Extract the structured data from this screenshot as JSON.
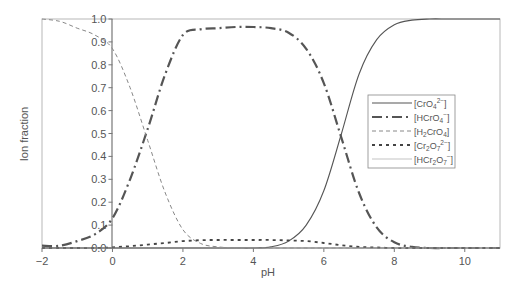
{
  "chart_data": {
    "type": "line",
    "title": "",
    "xlabel": "pH",
    "ylabel": "Ion fraction",
    "xlim": [
      -2,
      11
    ],
    "ylim": [
      0,
      1.0
    ],
    "x_ticks": [
      -2,
      0,
      2,
      4,
      6,
      8,
      10
    ],
    "x_tick_labels": [
      "−2",
      "0",
      "2",
      "4",
      "6",
      "8",
      "10"
    ],
    "y_ticks": [
      0.0,
      0.1,
      0.2,
      0.3,
      0.4,
      0.5,
      0.6,
      0.7,
      0.8,
      0.9,
      1.0
    ],
    "y_tick_labels": [
      "0.0",
      "0.1",
      "0.2",
      "0.3",
      "0.4",
      "0.5",
      "0.6",
      "0.7",
      "0.8",
      "0.9",
      "1.0"
    ],
    "grid": false,
    "legend_position": "right-middle",
    "x": [
      -2,
      -1.5,
      -1,
      -0.5,
      0,
      0.5,
      1,
      1.5,
      2,
      2.5,
      3,
      3.5,
      4,
      4.5,
      5,
      5.5,
      6,
      6.5,
      7,
      7.5,
      8,
      8.5,
      9,
      9.5,
      10,
      10.5,
      11
    ],
    "series": [
      {
        "name": "[CrO4 2-]",
        "label_parts": [
          "[CrO",
          "4",
          "2−",
          "]"
        ],
        "style": "solid",
        "color": "#555555",
        "width": 1.1,
        "values": [
          0,
          0,
          0,
          0,
          0,
          0,
          0,
          0,
          0,
          0,
          0,
          0,
          0,
          0.005,
          0.03,
          0.1,
          0.25,
          0.5,
          0.76,
          0.91,
          0.975,
          0.995,
          1.0,
          1.0,
          1.0,
          1.0,
          1.0
        ]
      },
      {
        "name": "[HCrO4 -]",
        "label_parts": [
          "[HCrO",
          "4",
          "−",
          "]"
        ],
        "style": "dashdot",
        "color": "#555555",
        "width": 2.2,
        "values": [
          0.01,
          0.01,
          0.03,
          0.06,
          0.13,
          0.3,
          0.52,
          0.76,
          0.93,
          0.955,
          0.96,
          0.965,
          0.965,
          0.96,
          0.94,
          0.87,
          0.72,
          0.48,
          0.24,
          0.09,
          0.025,
          0.005,
          0,
          0,
          0,
          0,
          0
        ]
      },
      {
        "name": "[H2CrO4]",
        "label_parts": [
          "[H",
          "2",
          "CrO",
          "4",
          "]"
        ],
        "style": "dashed",
        "color": "#888888",
        "width": 1.0,
        "values": [
          1.0,
          0.99,
          0.96,
          0.93,
          0.87,
          0.7,
          0.47,
          0.24,
          0.08,
          0.02,
          0.005,
          0,
          0,
          0,
          0,
          0,
          0,
          0,
          0,
          0,
          0,
          0,
          0,
          0,
          0,
          0,
          0
        ]
      },
      {
        "name": "[Cr2O7 2-]",
        "label_parts": [
          "[Cr",
          "2",
          "O",
          "7",
          "2−",
          "]"
        ],
        "style": "dotted",
        "color": "#444444",
        "width": 1.8,
        "values": [
          0,
          0,
          0,
          0,
          0.003,
          0.008,
          0.015,
          0.022,
          0.03,
          0.034,
          0.035,
          0.035,
          0.035,
          0.035,
          0.033,
          0.03,
          0.022,
          0.012,
          0.005,
          0.002,
          0,
          0,
          0,
          0,
          0,
          0,
          0
        ]
      },
      {
        "name": "[HCr2O7 -]",
        "label_parts": [
          "[HCr",
          "2",
          "O",
          "7",
          "−",
          "]"
        ],
        "style": "thin-solid",
        "color": "#aaaaaa",
        "width": 0.7,
        "values": [
          0,
          0,
          0,
          0,
          0,
          0,
          0,
          0,
          0,
          0,
          0,
          0,
          0,
          0,
          0,
          0,
          0,
          0,
          0,
          0,
          0,
          0,
          0,
          0,
          0,
          0,
          0
        ]
      }
    ]
  },
  "axes": {
    "xlabel": "pH",
    "ylabel": "Ion fraction"
  }
}
